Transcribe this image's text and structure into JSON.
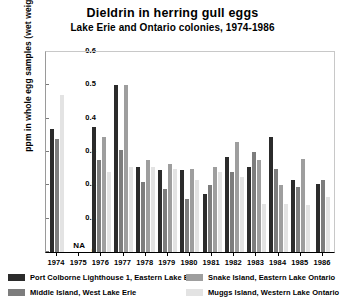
{
  "chart_data": {
    "type": "bar",
    "title": "Dieldrin in herring gull eggs",
    "subtitle": "Lake Erie and Ontario colonies, 1974-1986",
    "xlabel": "",
    "ylabel": "ppm in whole egg samples (wet weight)",
    "ylim": [
      0,
      0.6
    ],
    "ytick_labels": [
      "0.6",
      "0.5",
      "0.4",
      "0.3",
      "0.2",
      "0.1",
      "0"
    ],
    "ytick_values": [
      0.6,
      0.5,
      0.4,
      0.3,
      0.2,
      0.1,
      0
    ],
    "grid": false,
    "legend_position": "bottom",
    "categories": [
      "1974",
      "1975",
      "1976",
      "1977",
      "1978",
      "1979",
      "1980",
      "1981",
      "1982",
      "1983",
      "1984",
      "1985",
      "1986"
    ],
    "series": [
      {
        "name": "Port Colborne Lighthouse 1, Eastern Lake Erie",
        "color": "#2b2b2b",
        "values": [
          0.37,
          null,
          0.375,
          0.5,
          0.255,
          0.245,
          0.245,
          0.175,
          0.285,
          0.255,
          0.345,
          0.215,
          0.205
        ]
      },
      {
        "name": "Middle Island, West Lake Erie",
        "color": "#7d7d7d",
        "values": [
          0.34,
          null,
          0.275,
          0.305,
          0.21,
          0.19,
          0.16,
          0.2,
          0.24,
          0.3,
          0.25,
          0.195,
          0.215
        ]
      },
      {
        "name": "Snake Island, Eastern Lake Ontario",
        "color": "#9e9e9e",
        "values": [
          null,
          null,
          0.345,
          0.5,
          0.275,
          0.265,
          0.25,
          0.255,
          0.33,
          0.275,
          0.2,
          0.28,
          null
        ]
      },
      {
        "name": "Muggs Island, Western Lake Ontario",
        "color": "#e3e3e3",
        "values": [
          0.47,
          null,
          0.24,
          0.255,
          0.255,
          0.25,
          0.215,
          0.24,
          0.225,
          0.145,
          0.145,
          0.14,
          0.165
        ]
      }
    ],
    "annotations": [
      {
        "text": "NA",
        "category": "1976",
        "note": "no data for 1976 group"
      }
    ]
  },
  "legend": {
    "entries": [
      {
        "label": "Port Colborne Lighthouse 1, Eastern Lake Erie",
        "color": "#2b2b2b"
      },
      {
        "label": "Middle Island, West Lake Erie",
        "color": "#7d7d7d"
      },
      {
        "label": "Snake Island, Eastern Lake Ontario",
        "color": "#9e9e9e"
      },
      {
        "label": "Muggs Island, Western Lake Ontario",
        "color": "#e3e3e3"
      }
    ]
  }
}
